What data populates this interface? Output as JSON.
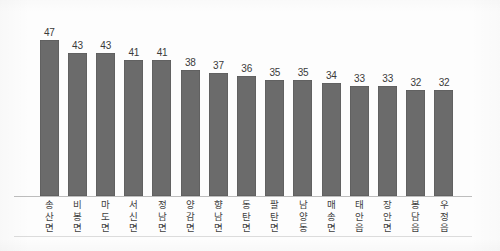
{
  "chart_data": {
    "type": "bar",
    "title": "",
    "subtitle": "",
    "xlabel": "",
    "ylabel": "",
    "ylim": [
      0,
      52
    ],
    "grid": false,
    "legend": "none",
    "bar_color": "#6b6b6b",
    "value_label_color": "#3a3a3a",
    "axis_color": "#bdbdbd",
    "categories": [
      "송산면",
      "비봉면",
      "마도면",
      "서신면",
      "정남면",
      "양감면",
      "향남면",
      "동탄면",
      "팔탄면",
      "남양동",
      "매송면",
      "태안읍",
      "장안면",
      "봉담읍",
      "우정읍"
    ],
    "values": [
      47,
      43,
      43,
      41,
      41,
      38,
      37,
      36,
      35,
      35,
      34,
      33,
      33,
      32,
      32
    ],
    "value_labels": [
      "47",
      "43",
      "43",
      "41",
      "41",
      "38",
      "37",
      "36",
      "35",
      "35",
      "34",
      "33",
      "33",
      "32",
      "32"
    ]
  }
}
